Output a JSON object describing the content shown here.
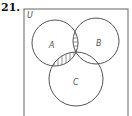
{
  "problem": {
    "number": "21."
  },
  "diagram": {
    "type": "venn",
    "universe_label": "U",
    "sets": [
      {
        "name": "A",
        "label": "A"
      },
      {
        "name": "B",
        "label": "B"
      },
      {
        "name": "C",
        "label": "C"
      }
    ],
    "shaded_regions": [
      {
        "region": "A ∩ B",
        "pattern": "horizontal-lines"
      },
      {
        "region": "A ∩ C",
        "pattern": "vertical-lines"
      },
      {
        "region": "A ∩ B ∩ C",
        "pattern": "crosshatch"
      }
    ],
    "colors": {
      "stroke": "#555555",
      "hatch": "#777777",
      "background": "#ffffff"
    }
  }
}
